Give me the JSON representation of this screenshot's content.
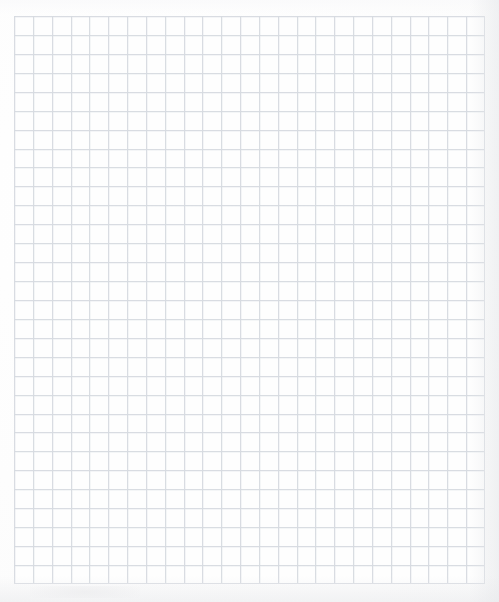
{
  "document": {
    "kind": "grid-paper-scan",
    "title": "Blank quadrille grid paper",
    "visible_text": "",
    "canvas": {
      "width_px": 499,
      "height_px": 602,
      "background_color": "#fdfdfd"
    }
  },
  "grid": {
    "label": "ruled-grid",
    "left_px": 14,
    "top_px": 16,
    "width_px": 471,
    "height_px": 568,
    "columns": 25,
    "rows": 30,
    "cell_width_px": 18.84,
    "cell_height_px": 18.93,
    "line_color": "#dcdfe4",
    "line_width_px": 1,
    "cell_fill_color": "#fefefe",
    "has_major_lines": false,
    "has_labels": false
  },
  "margins": {
    "left_px": 14,
    "top_px": 16,
    "right_px": 14,
    "bottom_px": 18,
    "color": "#ffffff"
  },
  "scan_artifacts": {
    "right_edge_shadow_color": "#e4e6e9",
    "bottom_edge_shadow_color": "#e7e8eb",
    "blur_pass_opacity": 0.45
  }
}
